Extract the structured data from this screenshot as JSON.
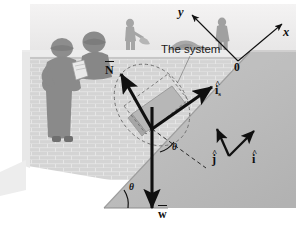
{
  "figure": {
    "type": "physics-free-body-diagram",
    "scene_description": "Construction workers behind a brick wall with a sloped embankment; a block rests on the incline",
    "width": 296,
    "height": 232
  },
  "labels": {
    "system": "The system",
    "origin": "0",
    "axis_y": "y",
    "axis_x": "x",
    "normal_force": "N",
    "incline_unit_vector": "i",
    "incline_unit_vector_subscript": "s",
    "weight": "w",
    "unit_vector_j": "j",
    "unit_vector_i": "i",
    "angle_incline": "θ",
    "angle_weight": "θ"
  },
  "vectors": [
    {
      "name": "normal-force",
      "label": "N",
      "notation": "overbar",
      "from": [
        152,
        129
      ],
      "to": [
        120,
        73
      ],
      "description": "Normal force perpendicular to the incline surface"
    },
    {
      "name": "incline-unit-vector",
      "label": "i_s",
      "notation": "hat",
      "from": [
        152,
        129
      ],
      "to": [
        213,
        86
      ],
      "description": "Unit vector along the incline surface pointing up-slope"
    },
    {
      "name": "weight",
      "label": "w",
      "notation": "overbar",
      "from": [
        152,
        108
      ],
      "to": [
        152,
        211
      ],
      "description": "Weight vector pointing vertically downward"
    },
    {
      "name": "unit-vector-j",
      "label": "j",
      "notation": "hat",
      "from": [
        228,
        155
      ],
      "to": [
        216,
        128
      ],
      "description": "Vertical unit vector j"
    },
    {
      "name": "unit-vector-i",
      "label": "i",
      "notation": "hat",
      "from": [
        228,
        155
      ],
      "to": [
        255,
        130
      ],
      "description": "Horizontal unit vector i"
    },
    {
      "name": "axis-y",
      "label": "y",
      "from": [
        238,
        61
      ],
      "to": [
        190,
        13
      ],
      "description": "Coordinate axis y from origin"
    },
    {
      "name": "axis-x",
      "label": "x",
      "from": [
        238,
        61
      ],
      "to": [
        284,
        22
      ],
      "description": "Coordinate axis x from origin"
    }
  ],
  "angles": [
    {
      "name": "incline-base-angle",
      "label": "θ",
      "position": [
        127,
        184
      ],
      "description": "Angle of the incline with the horizontal"
    },
    {
      "name": "weight-incline-angle",
      "label": "θ",
      "position": [
        175,
        146
      ],
      "description": "Angle between the weight vector and the normal to the incline"
    }
  ],
  "colors": {
    "vector_stroke": "#101010",
    "wall_brick_light": "#d8d8d8",
    "wall_brick_mortar": "#f2f2f2",
    "incline_fill": "#bdbdbd",
    "sky": "#eceaea",
    "ground_strip": "#d2d2d2",
    "worker_gray": "#8f8f8f",
    "block_fill": "#b6b6b6",
    "text": "#101010"
  }
}
